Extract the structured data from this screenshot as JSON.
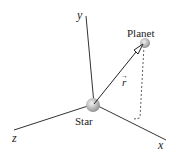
{
  "diagram": {
    "axes": {
      "x": {
        "label": "x"
      },
      "y": {
        "label": "y"
      },
      "z": {
        "label": "z"
      }
    },
    "bodies": {
      "star": {
        "label": "Star"
      },
      "planet": {
        "label": "Planet"
      }
    },
    "vector": {
      "label": "r",
      "arrow": "→"
    },
    "colors": {
      "line": "#333333",
      "sphere_fill": "#b8b8b8",
      "sphere_edge": "#8a8a8a",
      "arrowhead_fill": "#ffffff"
    }
  }
}
